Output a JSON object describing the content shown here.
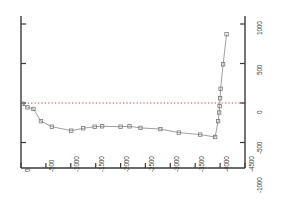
{
  "chart_data": {
    "type": "line",
    "title": "",
    "xlabel": "",
    "ylabel": "",
    "xlim": [
      0,
      -4500
    ],
    "ylim": [
      -1000,
      1000
    ],
    "grid": false,
    "legend": null,
    "x_ticks": [
      "0",
      "-500",
      "-1000",
      "-1500",
      "-2000",
      "-2500",
      "-3000",
      "-3500",
      "-4000",
      "-4500"
    ],
    "x_tick_values": [
      0,
      -500,
      -1000,
      -1500,
      -2000,
      -2500,
      -3000,
      -3500,
      -4000,
      -4500
    ],
    "y_ticks": [
      "1000",
      "500",
      "0",
      "-500",
      "-1000"
    ],
    "y_tick_values": [
      1000,
      500,
      0,
      -500,
      -1000
    ],
    "y_axis_side": "right",
    "zero_line": {
      "value": 0,
      "style": "dotted",
      "color": "#b03030"
    },
    "marker": "square-open",
    "line_color": "#888888",
    "marker_color": "#777777",
    "series": [
      {
        "name": "series-1",
        "x": [
          -30,
          -130,
          -250,
          -400,
          -620,
          -1010,
          -1250,
          -1480,
          -1630,
          -2000,
          -2180,
          -2400,
          -2800,
          -3170,
          -3600,
          -3900,
          -3960,
          -3980,
          -3990,
          -4000,
          -4010,
          -4060,
          -4130
        ],
        "y": [
          -10,
          -55,
          -75,
          -230,
          -300,
          -350,
          -320,
          -300,
          -295,
          -300,
          -295,
          -315,
          -330,
          -375,
          -400,
          -430,
          -230,
          -120,
          -40,
          60,
          180,
          490,
          870
        ]
      }
    ]
  },
  "axes": {
    "frame_color": "#3a3a3a",
    "background": "#ffffff"
  }
}
